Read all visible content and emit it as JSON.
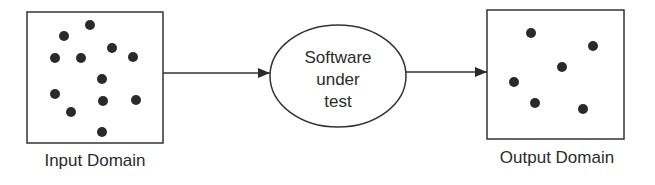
{
  "colors": {
    "stroke": "#333333",
    "dot": "#2a2a2a",
    "text": "#2b2b2b",
    "background": "#ffffff"
  },
  "input_domain": {
    "label": "Input Domain",
    "box": {
      "x": 27,
      "y": 12,
      "width": 136,
      "height": 131
    },
    "dots": [
      {
        "x": 90,
        "y": 25
      },
      {
        "x": 64,
        "y": 36
      },
      {
        "x": 112,
        "y": 48
      },
      {
        "x": 55,
        "y": 58
      },
      {
        "x": 81,
        "y": 58
      },
      {
        "x": 133,
        "y": 57
      },
      {
        "x": 102,
        "y": 79
      },
      {
        "x": 55,
        "y": 94
      },
      {
        "x": 103,
        "y": 101
      },
      {
        "x": 136,
        "y": 100
      },
      {
        "x": 71,
        "y": 112
      },
      {
        "x": 102,
        "y": 132
      }
    ]
  },
  "process": {
    "lines": [
      "Software",
      "under",
      "test"
    ],
    "ellipse": {
      "cx": 338,
      "cy": 76,
      "rx": 68,
      "ry": 51
    }
  },
  "output_domain": {
    "label": "Output Domain",
    "box": {
      "x": 487,
      "y": 10,
      "width": 137,
      "height": 129
    },
    "dots": [
      {
        "x": 531,
        "y": 33
      },
      {
        "x": 593,
        "y": 46
      },
      {
        "x": 562,
        "y": 67
      },
      {
        "x": 514,
        "y": 82
      },
      {
        "x": 535,
        "y": 103
      },
      {
        "x": 583,
        "y": 109
      }
    ]
  },
  "arrows": [
    {
      "from": "input_domain",
      "to": "process",
      "x1": 163,
      "y1": 73,
      "x2": 270,
      "y2": 73
    },
    {
      "from": "process",
      "to": "output_domain",
      "x1": 406,
      "y1": 72,
      "x2": 487,
      "y2": 72
    }
  ]
}
